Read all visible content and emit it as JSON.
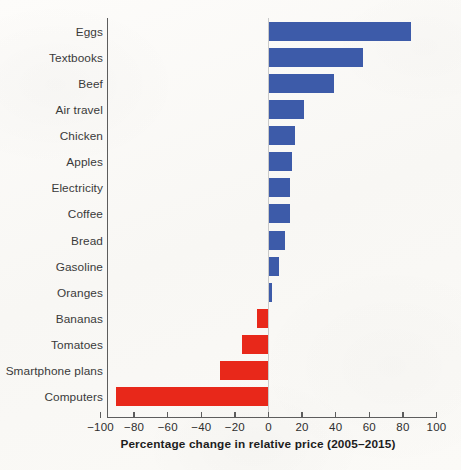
{
  "chart_data": {
    "type": "bar",
    "orientation": "horizontal",
    "title": "",
    "xlabel": "Percentage change in relative price (2005–2015)",
    "ylabel": "",
    "xlim": [
      -100,
      100
    ],
    "grid": false,
    "legend": "none",
    "categories": [
      "Eggs",
      "Textbooks",
      "Beef",
      "Air travel",
      "Chicken",
      "Apples",
      "Electricity",
      "Coffee",
      "Bread",
      "Gasoline",
      "Oranges",
      "Bananas",
      "Tomatoes",
      "Smartphone plans",
      "Computers"
    ],
    "values": [
      85,
      56,
      39,
      21,
      16,
      14,
      13,
      13,
      10,
      6,
      2,
      -7,
      -16,
      -29,
      -91
    ],
    "xticks": [
      -100,
      -80,
      -60,
      -40,
      -20,
      0,
      20,
      40,
      60,
      80,
      100
    ],
    "xticklabels": [
      "−100",
      "−80",
      "−60",
      "−40",
      "−20",
      "0",
      "20",
      "40",
      "60",
      "80",
      "100"
    ],
    "colors": {
      "positive": "#3d5ba9",
      "negative": "#e8281a",
      "axis": "#5d5d5d",
      "zero_line": "#c9c9c9",
      "text": "#3a3a3a",
      "background": "#fbfaf8"
    }
  }
}
